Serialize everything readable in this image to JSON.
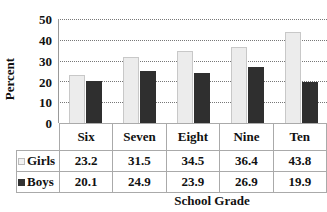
{
  "chart_data": {
    "type": "bar",
    "title": "",
    "xlabel": "School Grade",
    "ylabel": "Percent",
    "ylim": [
      0,
      50
    ],
    "yticks": [
      0,
      10,
      20,
      30,
      40,
      50
    ],
    "grid": true,
    "legend_position": "data-table",
    "categories": [
      "Six",
      "Seven",
      "Eight",
      "Nine",
      "Ten"
    ],
    "series": [
      {
        "name": "Girls",
        "color": "#ececec",
        "values": [
          23.2,
          31.5,
          34.5,
          36.4,
          43.8
        ]
      },
      {
        "name": "Boys",
        "color": "#2f2f2f",
        "values": [
          20.1,
          24.9,
          23.9,
          26.9,
          19.9
        ]
      }
    ]
  },
  "labels": {
    "ylabel": "Percent",
    "xlabel": "School Grade",
    "yticks": [
      "50",
      "40",
      "30",
      "20",
      "10",
      "0"
    ],
    "categories": [
      "Six",
      "Seven",
      "Eight",
      "Nine",
      "Ten"
    ],
    "girls": {
      "name": "Girls",
      "values": [
        "23.2",
        "31.5",
        "34.5",
        "36.4",
        "43.8"
      ]
    },
    "boys": {
      "name": "Boys",
      "values": [
        "20.1",
        "24.9",
        "23.9",
        "26.9",
        "19.9"
      ]
    }
  }
}
